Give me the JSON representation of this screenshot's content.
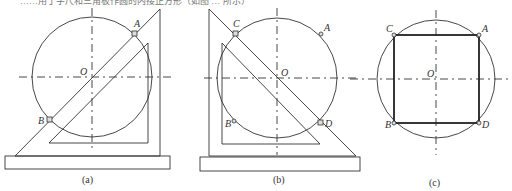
{
  "top_text": "……用丁字尺和三角板作圆的内接正方形（如图 … 所示）",
  "panels": [
    {
      "id": "a",
      "caption": "(a)",
      "points": {
        "A": "A",
        "B": "B",
        "O": "O"
      }
    },
    {
      "id": "b",
      "caption": "(b)",
      "points": {
        "A": "A",
        "B": "B",
        "C": "C",
        "D": "D",
        "O": "O"
      }
    },
    {
      "id": "c",
      "caption": "(c)",
      "points": {
        "A": "A",
        "B": "B",
        "C": "C",
        "D": "D",
        "O": "O"
      }
    }
  ]
}
